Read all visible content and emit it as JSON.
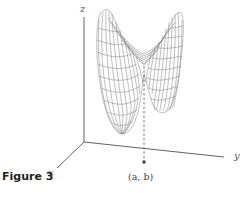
{
  "figure": {
    "caption": "Figure 3"
  },
  "axes": {
    "x_label": "x",
    "y_label": "y",
    "z_label": "z"
  },
  "point": {
    "label": "(a, b)",
    "a": "a",
    "b": "b"
  },
  "colors": {
    "surface_line": "#8a8a8a",
    "axis_line": "#3a3a3a",
    "caption": "#222222"
  }
}
